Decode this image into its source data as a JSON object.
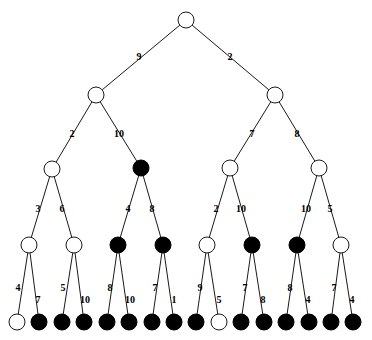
{
  "figure": {
    "name": "binary-tree-diagram",
    "width": 372,
    "height": 340,
    "background": "#ffffff",
    "node_stroke": "#1a1a1a",
    "node_open_fill": "#ffffff",
    "node_filled_fill": "#000000",
    "edge_color": "#1a1a1a"
  },
  "levels": [
    {
      "index": 0,
      "y": 20,
      "node_radius": 8
    },
    {
      "index": 1,
      "y": 95,
      "node_radius": 8
    },
    {
      "index": 2,
      "y": 168,
      "node_radius": 8
    },
    {
      "index": 3,
      "y": 245,
      "node_radius": 8
    },
    {
      "index": 4,
      "y": 322,
      "node_radius": 8
    }
  ],
  "nodes": [
    {
      "id": "n0",
      "level": 0,
      "x": 186,
      "y": 20,
      "r": 8,
      "fill": "open"
    },
    {
      "id": "n1",
      "level": 1,
      "x": 96,
      "y": 95,
      "r": 8,
      "fill": "open"
    },
    {
      "id": "n2",
      "level": 1,
      "x": 275,
      "y": 95,
      "r": 8,
      "fill": "open"
    },
    {
      "id": "n3",
      "level": 2,
      "x": 52,
      "y": 169,
      "r": 8,
      "fill": "open"
    },
    {
      "id": "n4",
      "level": 2,
      "x": 141,
      "y": 168,
      "r": 8,
      "fill": "filled"
    },
    {
      "id": "n5",
      "level": 2,
      "x": 230,
      "y": 168,
      "r": 8,
      "fill": "open"
    },
    {
      "id": "n6",
      "level": 2,
      "x": 319,
      "y": 168,
      "r": 8,
      "fill": "open"
    },
    {
      "id": "n7",
      "level": 3,
      "x": 29,
      "y": 245,
      "r": 8,
      "fill": "open"
    },
    {
      "id": "n8",
      "level": 3,
      "x": 74,
      "y": 245,
      "r": 8,
      "fill": "open"
    },
    {
      "id": "n9",
      "level": 3,
      "x": 118,
      "y": 245,
      "r": 8,
      "fill": "filled"
    },
    {
      "id": "n10",
      "level": 3,
      "x": 163,
      "y": 245,
      "r": 8,
      "fill": "filled"
    },
    {
      "id": "n11",
      "level": 3,
      "x": 207,
      "y": 245,
      "r": 8,
      "fill": "open"
    },
    {
      "id": "n12",
      "level": 3,
      "x": 252,
      "y": 245,
      "r": 8,
      "fill": "filled"
    },
    {
      "id": "n13",
      "level": 3,
      "x": 297,
      "y": 245,
      "r": 8,
      "fill": "filled"
    },
    {
      "id": "n14",
      "level": 3,
      "x": 341,
      "y": 245,
      "r": 8,
      "fill": "open"
    },
    {
      "id": "l0",
      "level": 4,
      "x": 17,
      "y": 322,
      "r": 8,
      "fill": "open"
    },
    {
      "id": "l1",
      "level": 4,
      "x": 39,
      "y": 322,
      "r": 8,
      "fill": "filled"
    },
    {
      "id": "l2",
      "level": 4,
      "x": 62,
      "y": 322,
      "r": 8,
      "fill": "filled"
    },
    {
      "id": "l3",
      "level": 4,
      "x": 84,
      "y": 322,
      "r": 8,
      "fill": "filled"
    },
    {
      "id": "l4",
      "level": 4,
      "x": 107,
      "y": 322,
      "r": 8,
      "fill": "filled"
    },
    {
      "id": "l5",
      "level": 4,
      "x": 129,
      "y": 322,
      "r": 8,
      "fill": "filled"
    },
    {
      "id": "l6",
      "level": 4,
      "x": 152,
      "y": 322,
      "r": 8,
      "fill": "filled"
    },
    {
      "id": "l7",
      "level": 4,
      "x": 174,
      "y": 322,
      "r": 8,
      "fill": "filled"
    },
    {
      "id": "l8",
      "level": 4,
      "x": 196,
      "y": 322,
      "r": 8,
      "fill": "filled"
    },
    {
      "id": "l9",
      "level": 4,
      "x": 219,
      "y": 322,
      "r": 8,
      "fill": "open"
    },
    {
      "id": "l10",
      "level": 4,
      "x": 241,
      "y": 322,
      "r": 8,
      "fill": "filled"
    },
    {
      "id": "l11",
      "level": 4,
      "x": 264,
      "y": 322,
      "r": 8,
      "fill": "filled"
    },
    {
      "id": "l12",
      "level": 4,
      "x": 286,
      "y": 322,
      "r": 8,
      "fill": "filled"
    },
    {
      "id": "l13",
      "level": 4,
      "x": 309,
      "y": 322,
      "r": 8,
      "fill": "filled"
    },
    {
      "id": "l14",
      "level": 4,
      "x": 331,
      "y": 322,
      "r": 8,
      "fill": "filled"
    },
    {
      "id": "l15",
      "level": 4,
      "x": 353,
      "y": 322,
      "r": 8,
      "fill": "filled"
    }
  ],
  "edges": [
    {
      "from": "n0",
      "to": "n1",
      "label": "9",
      "lx": 139,
      "ly": 57
    },
    {
      "from": "n0",
      "to": "n2",
      "label": "2",
      "lx": 230,
      "ly": 57
    },
    {
      "from": "n1",
      "to": "n3",
      "label": "2",
      "lx": 72,
      "ly": 134
    },
    {
      "from": "n1",
      "to": "n4",
      "label": "10",
      "lx": 119,
      "ly": 134
    },
    {
      "from": "n2",
      "to": "n5",
      "label": "7",
      "lx": 252,
      "ly": 134
    },
    {
      "from": "n2",
      "to": "n6",
      "label": "8",
      "lx": 297,
      "ly": 134
    },
    {
      "from": "n3",
      "to": "n7",
      "label": "3",
      "lx": 38,
      "ly": 209
    },
    {
      "from": "n3",
      "to": "n8",
      "label": "6",
      "lx": 62,
      "ly": 209
    },
    {
      "from": "n4",
      "to": "n9",
      "label": "4",
      "lx": 128,
      "ly": 209
    },
    {
      "from": "n4",
      "to": "n10",
      "label": "8",
      "lx": 152,
      "ly": 209
    },
    {
      "from": "n5",
      "to": "n11",
      "label": "2",
      "lx": 216,
      "ly": 209
    },
    {
      "from": "n5",
      "to": "n12",
      "label": "10",
      "lx": 241,
      "ly": 209
    },
    {
      "from": "n6",
      "to": "n13",
      "label": "10",
      "lx": 306,
      "ly": 209
    },
    {
      "from": "n6",
      "to": "n14",
      "label": "5",
      "lx": 330,
      "ly": 209
    },
    {
      "from": "n7",
      "to": "l0",
      "label": "4",
      "lx": 18,
      "ly": 288
    },
    {
      "from": "n7",
      "to": "l1",
      "label": "7",
      "lx": 38,
      "ly": 300
    },
    {
      "from": "n8",
      "to": "l2",
      "label": "5",
      "lx": 63,
      "ly": 288
    },
    {
      "from": "n8",
      "to": "l3",
      "label": "10",
      "lx": 85,
      "ly": 300
    },
    {
      "from": "n9",
      "to": "l4",
      "label": "8",
      "lx": 110,
      "ly": 288
    },
    {
      "from": "n9",
      "to": "l5",
      "label": "10",
      "lx": 130,
      "ly": 300
    },
    {
      "from": "n10",
      "to": "l6",
      "label": "7",
      "lx": 155,
      "ly": 288
    },
    {
      "from": "n10",
      "to": "l7",
      "label": "1",
      "lx": 174,
      "ly": 300
    },
    {
      "from": "n11",
      "to": "l8",
      "label": "9",
      "lx": 200,
      "ly": 288
    },
    {
      "from": "n11",
      "to": "l9",
      "label": "5",
      "lx": 219,
      "ly": 300
    },
    {
      "from": "n12",
      "to": "l10",
      "label": "7",
      "lx": 245,
      "ly": 288
    },
    {
      "from": "n12",
      "to": "l11",
      "label": "8",
      "lx": 263,
      "ly": 300
    },
    {
      "from": "n13",
      "to": "l12",
      "label": "8",
      "lx": 290,
      "ly": 288
    },
    {
      "from": "n13",
      "to": "l13",
      "label": "4",
      "lx": 308,
      "ly": 300
    },
    {
      "from": "n14",
      "to": "l14",
      "label": "7",
      "lx": 334,
      "ly": 288
    },
    {
      "from": "n14",
      "to": "l15",
      "label": "4",
      "lx": 352,
      "ly": 300
    }
  ]
}
